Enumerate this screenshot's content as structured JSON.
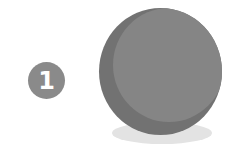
{
  "step_badge": {
    "number": "1",
    "color": "#8a8a8a",
    "text_color": "#ffffff"
  },
  "illustration": {
    "icon": "sphere-icon",
    "sphere_shade_color": "#727272",
    "sphere_face_color": "#858585",
    "shadow_color": "#e3e3e3"
  }
}
